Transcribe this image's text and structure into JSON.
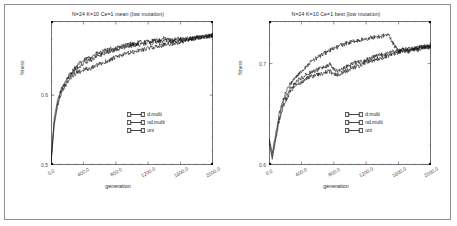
{
  "figure": {
    "caption": ""
  },
  "panels": [
    {
      "id": "mean",
      "title": "N=24 K=10 Ce=1 mean (low mutation)",
      "xlabel": "generation",
      "ylabel": "fitness",
      "xticks": [
        "0.0",
        "400.0",
        "800.0",
        "1200.0",
        "1600.0",
        "2000.0"
      ],
      "yticks": [
        "0.5",
        "0.6"
      ],
      "legend": [
        {
          "label": "d.multi"
        },
        {
          "label": "nd.multi"
        },
        {
          "label": "uni"
        }
      ]
    },
    {
      "id": "best",
      "title": "N=24 K=10 Ce=1 best (low mutation)",
      "xlabel": "generation",
      "ylabel": "fitness",
      "xticks": [
        "0.0",
        "400.0",
        "800.0",
        "1200.0",
        "1600.0",
        "2000.0"
      ],
      "yticks": [
        "0.6",
        "0.7"
      ],
      "legend": [
        {
          "label": "d.multi"
        },
        {
          "label": "nd.multi"
        },
        {
          "label": "uni"
        }
      ]
    }
  ],
  "chart_data": [
    {
      "type": "line",
      "title": "N=24 K=10 Ce=1 mean (low mutation)",
      "xlabel": "generation",
      "ylabel": "fitness",
      "xlim": [
        0,
        2000
      ],
      "ylim": [
        0.5,
        0.706
      ],
      "xticks": [
        0,
        400,
        800,
        1200,
        1600,
        2000
      ],
      "yticks": [
        0.5,
        0.6
      ],
      "grid": false,
      "legend_position": "lower-right",
      "x": [
        0,
        40,
        80,
        120,
        160,
        200,
        240,
        280,
        320,
        360,
        400,
        440,
        480,
        520,
        560,
        600,
        640,
        680,
        720,
        760,
        800,
        840,
        880,
        920,
        960,
        1000,
        1040,
        1080,
        1120,
        1160,
        1200,
        1240,
        1280,
        1320,
        1360,
        1400,
        1440,
        1480,
        1520,
        1560,
        1600,
        1640,
        1680,
        1720,
        1760,
        1800,
        1840,
        1880,
        1920,
        1960,
        2000
      ],
      "series": [
        {
          "name": "d.multi",
          "values": [
            0.504,
            0.567,
            0.592,
            0.606,
            0.617,
            0.624,
            0.631,
            0.637,
            0.641,
            0.646,
            0.649,
            0.652,
            0.654,
            0.657,
            0.659,
            0.66,
            0.662,
            0.664,
            0.665,
            0.666,
            0.667,
            0.669,
            0.67,
            0.671,
            0.673,
            0.674,
            0.673,
            0.675,
            0.676,
            0.676,
            0.677,
            0.677,
            0.678,
            0.678,
            0.679,
            0.681,
            0.68,
            0.678,
            0.679,
            0.68,
            0.68,
            0.681,
            0.681,
            0.682,
            0.682,
            0.683,
            0.683,
            0.684,
            0.684,
            0.685,
            0.686
          ]
        },
        {
          "name": "nd.multi",
          "values": [
            0.503,
            0.562,
            0.588,
            0.603,
            0.613,
            0.621,
            0.628,
            0.633,
            0.638,
            0.642,
            0.645,
            0.648,
            0.65,
            0.652,
            0.655,
            0.657,
            0.659,
            0.661,
            0.662,
            0.664,
            0.665,
            0.666,
            0.668,
            0.669,
            0.67,
            0.671,
            0.672,
            0.672,
            0.673,
            0.674,
            0.675,
            0.675,
            0.676,
            0.677,
            0.677,
            0.678,
            0.678,
            0.676,
            0.677,
            0.678,
            0.679,
            0.679,
            0.68,
            0.681,
            0.681,
            0.682,
            0.683,
            0.683,
            0.684,
            0.685,
            0.685
          ]
        },
        {
          "name": "uni",
          "values": [
            0.502,
            0.558,
            0.584,
            0.6,
            0.61,
            0.618,
            0.624,
            0.629,
            0.632,
            0.634,
            0.636,
            0.637,
            0.638,
            0.64,
            0.642,
            0.644,
            0.646,
            0.648,
            0.65,
            0.652,
            0.654,
            0.656,
            0.657,
            0.659,
            0.66,
            0.661,
            0.662,
            0.664,
            0.665,
            0.666,
            0.667,
            0.668,
            0.669,
            0.67,
            0.671,
            0.672,
            0.672,
            0.673,
            0.674,
            0.675,
            0.676,
            0.677,
            0.678,
            0.679,
            0.68,
            0.681,
            0.682,
            0.683,
            0.683,
            0.684,
            0.685
          ]
        }
      ]
    },
    {
      "type": "line",
      "title": "N=24 K=10 Ce=1 best (low mutation)",
      "xlabel": "generation",
      "ylabel": "fitness",
      "xlim": [
        0,
        2000
      ],
      "ylim": [
        0.6,
        0.742
      ],
      "xticks": [
        0,
        400,
        800,
        1200,
        1600,
        2000
      ],
      "yticks": [
        0.6,
        0.7
      ],
      "grid": false,
      "legend_position": "lower-right",
      "x": [
        0,
        40,
        80,
        120,
        160,
        200,
        240,
        280,
        320,
        360,
        400,
        440,
        480,
        520,
        560,
        600,
        640,
        680,
        720,
        760,
        800,
        840,
        880,
        920,
        960,
        1000,
        1040,
        1080,
        1120,
        1160,
        1200,
        1240,
        1280,
        1320,
        1360,
        1400,
        1440,
        1480,
        1520,
        1560,
        1600,
        1640,
        1680,
        1720,
        1760,
        1800,
        1840,
        1880,
        1920,
        1960,
        2000
      ],
      "series": [
        {
          "name": "d.multi",
          "values": [
            0.627,
            0.612,
            0.63,
            0.648,
            0.661,
            0.67,
            0.677,
            0.682,
            0.686,
            0.689,
            0.692,
            0.696,
            0.699,
            0.702,
            0.704,
            0.706,
            0.708,
            0.71,
            0.712,
            0.713,
            0.715,
            0.716,
            0.718,
            0.719,
            0.72,
            0.721,
            0.722,
            0.722,
            0.723,
            0.724,
            0.724,
            0.725,
            0.726,
            0.726,
            0.727,
            0.727,
            0.728,
            0.728,
            0.722,
            0.716,
            0.712,
            0.714,
            0.713,
            0.712,
            0.713,
            0.714,
            0.714,
            0.715,
            0.716,
            0.716,
            0.717
          ]
        },
        {
          "name": "nd.multi",
          "values": [
            0.625,
            0.608,
            0.626,
            0.644,
            0.657,
            0.666,
            0.672,
            0.677,
            0.681,
            0.684,
            0.686,
            0.688,
            0.69,
            0.691,
            0.693,
            0.694,
            0.696,
            0.697,
            0.698,
            0.7,
            0.694,
            0.693,
            0.694,
            0.696,
            0.697,
            0.698,
            0.7,
            0.701,
            0.702,
            0.703,
            0.704,
            0.705,
            0.706,
            0.707,
            0.708,
            0.709,
            0.71,
            0.711,
            0.712,
            0.712,
            0.713,
            0.713,
            0.714,
            0.714,
            0.715,
            0.715,
            0.716,
            0.716,
            0.717,
            0.717,
            0.718
          ]
        },
        {
          "name": "uni",
          "values": [
            0.624,
            0.606,
            0.624,
            0.641,
            0.654,
            0.663,
            0.669,
            0.674,
            0.678,
            0.68,
            0.682,
            0.684,
            0.686,
            0.687,
            0.688,
            0.689,
            0.69,
            0.691,
            0.692,
            0.692,
            0.69,
            0.689,
            0.69,
            0.692,
            0.693,
            0.694,
            0.696,
            0.697,
            0.698,
            0.7,
            0.701,
            0.702,
            0.703,
            0.704,
            0.705,
            0.706,
            0.707,
            0.708,
            0.709,
            0.71,
            0.711,
            0.712,
            0.713,
            0.713,
            0.714,
            0.715,
            0.715,
            0.716,
            0.716,
            0.717,
            0.717
          ]
        }
      ]
    }
  ]
}
